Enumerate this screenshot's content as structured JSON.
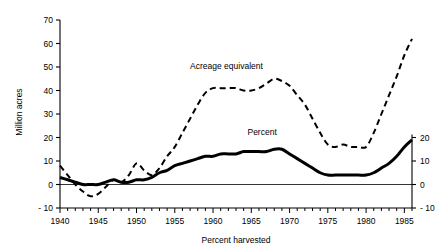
{
  "chart_data": {
    "type": "line",
    "title": "",
    "xlabel": "Percent harvested",
    "ylabel": "Million acres",
    "ylabel_right": "",
    "xlim": [
      1940,
      1986
    ],
    "ylim": [
      -10,
      70
    ],
    "ylim_right": [
      -10,
      20
    ],
    "grid": false,
    "legend_position": "inline-annotations",
    "x_ticks_major": [
      1940,
      1945,
      1950,
      1955,
      1960,
      1965,
      1970,
      1975,
      1980,
      1985
    ],
    "x_tick_labels": [
      "1940",
      "1945",
      "1950",
      "1955",
      "1960",
      "1965",
      "1970",
      "1975",
      "1980",
      "1985"
    ],
    "x_minor_tick_step": 1,
    "y_ticks_left": [
      -10,
      0,
      10,
      20,
      30,
      40,
      50,
      60,
      70
    ],
    "y_tick_labels_left": [
      "- 10",
      "0",
      "10",
      "20",
      "30",
      "40",
      "50",
      "60",
      "70"
    ],
    "y_ticks_right": [
      -10,
      0,
      10,
      20
    ],
    "y_tick_labels_right": [
      "- 10",
      "0",
      "10",
      "20"
    ],
    "series": [
      {
        "name": "Acreage equivalent",
        "axis": "left",
        "style": "dashed",
        "units": "Million acres",
        "x": [
          1940,
          1941,
          1942,
          1943,
          1944,
          1945,
          1946,
          1947,
          1948,
          1949,
          1950,
          1951,
          1952,
          1953,
          1954,
          1955,
          1956,
          1957,
          1958,
          1959,
          1960,
          1961,
          1962,
          1963,
          1964,
          1965,
          1966,
          1967,
          1968,
          1969,
          1970,
          1971,
          1972,
          1973,
          1974,
          1975,
          1976,
          1977,
          1978,
          1979,
          1980,
          1981,
          1982,
          1983,
          1984,
          1985,
          1986
        ],
        "values": [
          8,
          4,
          0,
          -3,
          -5,
          -4,
          -1,
          2,
          1,
          4,
          9,
          6,
          4,
          7,
          12,
          16,
          22,
          28,
          34,
          39,
          41,
          41,
          41,
          41,
          40,
          40,
          41,
          43,
          45,
          44,
          42,
          38,
          34,
          28,
          22,
          17,
          16,
          17,
          16,
          16,
          16,
          22,
          30,
          38,
          46,
          55,
          62
        ]
      },
      {
        "name": "Percent",
        "axis": "right",
        "style": "solid",
        "units": "Percent",
        "x": [
          1940,
          1941,
          1942,
          1943,
          1944,
          1945,
          1946,
          1947,
          1948,
          1949,
          1950,
          1951,
          1952,
          1953,
          1954,
          1955,
          1956,
          1957,
          1958,
          1959,
          1960,
          1961,
          1962,
          1963,
          1964,
          1965,
          1966,
          1967,
          1968,
          1969,
          1970,
          1971,
          1972,
          1973,
          1974,
          1975,
          1976,
          1977,
          1978,
          1979,
          1980,
          1981,
          1982,
          1983,
          1984,
          1985,
          1986
        ],
        "values": [
          3,
          2,
          1,
          0,
          0,
          0,
          1,
          2,
          1,
          1,
          2,
          2,
          3,
          5,
          6,
          8,
          9,
          10,
          11,
          12,
          12,
          13,
          13,
          13,
          14,
          14,
          14,
          14,
          15,
          15,
          13,
          11,
          9,
          7,
          5,
          4,
          4,
          4,
          4,
          4,
          4,
          5,
          7,
          9,
          12,
          16,
          19
        ]
      }
    ],
    "annotations": [
      {
        "text": "Acreage equivalent",
        "x": 1957,
        "y": 49
      },
      {
        "text": "Percent",
        "x": 1964.5,
        "y": 21
      }
    ]
  },
  "labels": {
    "y_axis_title": "Million acres",
    "x_axis_title": "Percent harvested",
    "series_acreage": "Acreage equivalent",
    "series_percent": "Percent"
  },
  "colors": {
    "line": "#000000",
    "axis": "#000000",
    "background": "#ffffff"
  }
}
